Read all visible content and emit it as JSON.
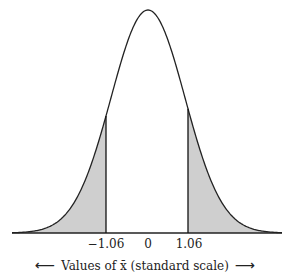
{
  "chart_data": {
    "type": "area",
    "title": "",
    "xlabel": "Values of x̄ (standard scale)",
    "ylabel": "",
    "x_ticks": [
      "-1.06",
      "0",
      "1.06"
    ],
    "x_tick_values": [
      -1.06,
      0,
      1.06
    ],
    "shaded_regions": [
      {
        "from": "-inf",
        "to": -1.06
      },
      {
        "from": 1.06,
        "to": "inf"
      }
    ],
    "distribution": {
      "mean": 0,
      "sd": 1
    },
    "grid": false,
    "legend": null,
    "fill_color": "#cfcfcf",
    "line_color": "#222222"
  },
  "axis": {
    "tick_left": "−1.06",
    "tick_center": "0",
    "tick_right": "1.06",
    "label": "Values of x̄ (standard scale)",
    "arrow_left": "⟵",
    "arrow_right": "⟶"
  }
}
